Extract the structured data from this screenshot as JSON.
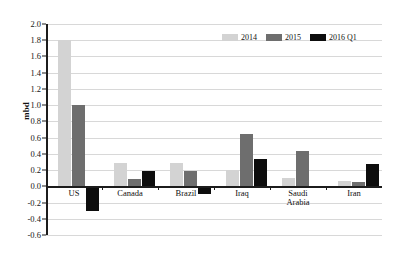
{
  "chart_data": {
    "type": "bar",
    "title": "",
    "xlabel": "",
    "ylabel": "mbd",
    "ylim": [
      -0.6,
      2.0
    ],
    "ytick_step": 0.2,
    "grid": true,
    "legend_position": "top-right",
    "categories": [
      "US",
      "Canada",
      "Brazil",
      "Iraq",
      "Saudi\nArabia",
      "Iran"
    ],
    "series": [
      {
        "name": "2014",
        "color": "#d3d3d3",
        "values": [
          1.8,
          0.29,
          0.29,
          0.2,
          0.1,
          0.06
        ]
      },
      {
        "name": "2015",
        "color": "#6e6e6e",
        "values": [
          1.0,
          0.09,
          0.19,
          0.64,
          0.44,
          0.05
        ]
      },
      {
        "name": "2016 Q1",
        "color": "#0d0d0d",
        "values": [
          -0.3,
          0.19,
          -0.09,
          0.34,
          0.01,
          0.27
        ]
      }
    ],
    "ytick_labels": [
      "2.0",
      "1.8",
      "1.6",
      "1.4",
      "1.2",
      "1.0",
      "0.8",
      "0.6",
      "0.4",
      "0.2",
      "0.0",
      "-0.2",
      "-0.4",
      "-0.6"
    ],
    "ytick_values": [
      2.0,
      1.8,
      1.6,
      1.4,
      1.2,
      1.0,
      0.8,
      0.6,
      0.4,
      0.2,
      0.0,
      -0.2,
      -0.4,
      -0.6
    ]
  }
}
